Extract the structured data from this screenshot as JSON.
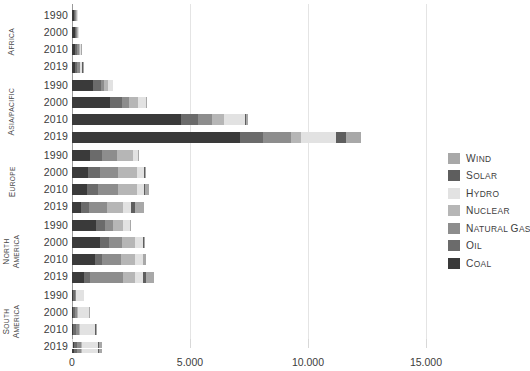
{
  "chart_data": {
    "type": "bar",
    "subtype": "stacked-horizontal-grouped",
    "title": "",
    "subtitle": "",
    "xlabel": "",
    "ylabel": "",
    "xlim": [
      0,
      15000
    ],
    "xticks": [
      0,
      5000,
      10000,
      15000
    ],
    "xtick_labels": [
      "0",
      "5.000",
      "10.000",
      "15.000"
    ],
    "grid": true,
    "legend_position": "right",
    "series": [
      {
        "name": "Wind",
        "color": "#a8a8a8"
      },
      {
        "name": "Solar",
        "color": "#5e5e5e"
      },
      {
        "name": "Hydro",
        "color": "#e2e2e2"
      },
      {
        "name": "Nuclear",
        "color": "#b6b6b6"
      },
      {
        "name": "Natural Gas",
        "color": "#8d8d8d"
      },
      {
        "name": "Oil",
        "color": "#6b6b6b"
      },
      {
        "name": "Coal",
        "color": "#3a3a3a"
      }
    ],
    "legend_labels": [
      "Wind",
      "Solar",
      "Hydro",
      "Nuclear",
      "Natural Gas",
      "Oil",
      "Coal"
    ],
    "groups": [
      {
        "region": "Africa",
        "rows": [
          {
            "year": "1990",
            "values": {
              "Coal": 95,
              "Oil": 40,
              "Natural Gas": 20,
              "Nuclear": 8,
              "Hydro": 30,
              "Solar": 0,
              "Wind": 0
            },
            "total": 193
          },
          {
            "year": "2000",
            "values": {
              "Coal": 110,
              "Oil": 55,
              "Natural Gas": 40,
              "Nuclear": 10,
              "Hydro": 35,
              "Solar": 0,
              "Wind": 0
            },
            "total": 250
          },
          {
            "year": "2010",
            "values": {
              "Coal": 130,
              "Oil": 70,
              "Natural Gas": 85,
              "Nuclear": 12,
              "Hydro": 45,
              "Solar": 2,
              "Wind": 2
            },
            "total": 346
          },
          {
            "year": "2019",
            "values": {
              "Coal": 125,
              "Oil": 85,
              "Natural Gas": 115,
              "Nuclear": 12,
              "Hydro": 60,
              "Solar": 8,
              "Wind": 10
            },
            "total": 415
          }
        ]
      },
      {
        "region": "Asia/Pacific",
        "rows": [
          {
            "year": "1990",
            "values": {
              "Coal": 900,
              "Oil": 330,
              "Natural Gas": 130,
              "Nuclear": 180,
              "Hydro": 200,
              "Solar": 0,
              "Wind": 0
            },
            "total": 1740
          },
          {
            "year": "2000",
            "values": {
              "Coal": 1600,
              "Oil": 520,
              "Natural Gas": 300,
              "Nuclear": 390,
              "Hydro": 310,
              "Solar": 2,
              "Wind": 5
            },
            "total": 3127
          },
          {
            "year": "2010",
            "values": {
              "Coal": 4600,
              "Oil": 760,
              "Natural Gas": 560,
              "Nuclear": 520,
              "Hydro": 880,
              "Solar": 20,
              "Wind": 120
            },
            "total": 7460
          },
          {
            "year": "2019",
            "values": {
              "Coal": 7100,
              "Oil": 980,
              "Natural Gas": 1180,
              "Nuclear": 440,
              "Hydro": 1500,
              "Solar": 420,
              "Wind": 620
            },
            "total": 12240
          }
        ]
      },
      {
        "region": "Europe",
        "rows": [
          {
            "year": "1990",
            "values": {
              "Coal": 760,
              "Oil": 520,
              "Natural Gas": 620,
              "Nuclear": 690,
              "Hydro": 220,
              "Solar": 0,
              "Wind": 5
            },
            "total": 2815
          },
          {
            "year": "2000",
            "values": {
              "Coal": 690,
              "Oil": 500,
              "Natural Gas": 750,
              "Nuclear": 830,
              "Hydro": 280,
              "Solar": 2,
              "Wind": 30
            },
            "total": 3082
          },
          {
            "year": "2010",
            "values": {
              "Coal": 640,
              "Oil": 450,
              "Natural Gas": 850,
              "Nuclear": 810,
              "Hydro": 320,
              "Solar": 25,
              "Wind": 160
            },
            "total": 3255
          },
          {
            "year": "2019",
            "values": {
              "Coal": 380,
              "Oil": 360,
              "Natural Gas": 760,
              "Nuclear": 680,
              "Hydro": 330,
              "Solar": 150,
              "Wind": 380
            },
            "total": 3040
          }
        ]
      },
      {
        "region": "North America",
        "rows": [
          {
            "year": "1990",
            "values": {
              "Coal": 1020,
              "Oil": 360,
              "Natural Gas": 360,
              "Nuclear": 420,
              "Hydro": 290,
              "Solar": 0,
              "Wind": 5
            },
            "total": 2455
          },
          {
            "year": "2000",
            "values": {
              "Coal": 1180,
              "Oil": 390,
              "Natural Gas": 560,
              "Nuclear": 520,
              "Hydro": 360,
              "Solar": 2,
              "Wind": 10
            },
            "total": 3022
          },
          {
            "year": "2010",
            "values": {
              "Coal": 960,
              "Oil": 300,
              "Natural Gas": 830,
              "Nuclear": 560,
              "Hydro": 340,
              "Solar": 10,
              "Wind": 110
            },
            "total": 3110
          },
          {
            "year": "2019",
            "values": {
              "Coal": 520,
              "Oil": 260,
              "Natural Gas": 1380,
              "Nuclear": 520,
              "Hydro": 330,
              "Solar": 110,
              "Wind": 350
            },
            "total": 3470
          }
        ]
      },
      {
        "region": "South America",
        "rows": [
          {
            "year": "1990",
            "values": {
              "Coal": 30,
              "Oil": 85,
              "Natural Gas": 35,
              "Nuclear": 10,
              "Hydro": 320,
              "Solar": 0,
              "Wind": 0
            },
            "total": 480
          },
          {
            "year": "2000",
            "values": {
              "Coal": 45,
              "Oil": 95,
              "Natural Gas": 85,
              "Nuclear": 15,
              "Hydro": 480,
              "Solar": 0,
              "Wind": 2
            },
            "total": 722
          },
          {
            "year": "2010",
            "values": {
              "Coal": 55,
              "Oil": 110,
              "Natural Gas": 150,
              "Nuclear": 20,
              "Hydro": 620,
              "Solar": 1,
              "Wind": 10
            },
            "total": 966
          },
          {
            "year": "2019",
            "values": {
              "Coal": 70,
              "Oil": 130,
              "Natural Gas": 200,
              "Nuclear": 22,
              "Hydro": 680,
              "Solar": 35,
              "Wind": 110
            },
            "total": 1247
          }
        ]
      }
    ]
  },
  "axis": {
    "x_tick_labels": [
      "0",
      "5.000",
      "10.000",
      "15.000"
    ]
  },
  "legend": {
    "items": [
      {
        "label": "Wind",
        "color": "#a8a8a8"
      },
      {
        "label": "Solar",
        "color": "#5e5e5e"
      },
      {
        "label": "Hydro",
        "color": "#e2e2e2"
      },
      {
        "label": "Nuclear",
        "color": "#b6b6b6"
      },
      {
        "label": "Natural Gas",
        "color": "#8d8d8d"
      },
      {
        "label": "Oil",
        "color": "#6b6b6b"
      },
      {
        "label": "Coal",
        "color": "#3a3a3a"
      }
    ]
  }
}
